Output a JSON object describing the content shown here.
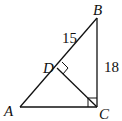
{
  "diagram": {
    "type": "right-triangle-with-altitude",
    "points": {
      "A": "A",
      "B": "B",
      "C": "C",
      "D": "D"
    },
    "segments": [
      {
        "from": "A",
        "to": "B"
      },
      {
        "from": "B",
        "to": "C"
      },
      {
        "from": "A",
        "to": "C"
      },
      {
        "from": "C",
        "to": "D"
      }
    ],
    "right_angles": [
      "C",
      "D"
    ],
    "labels": {
      "BD": "15",
      "BC": "18"
    }
  }
}
